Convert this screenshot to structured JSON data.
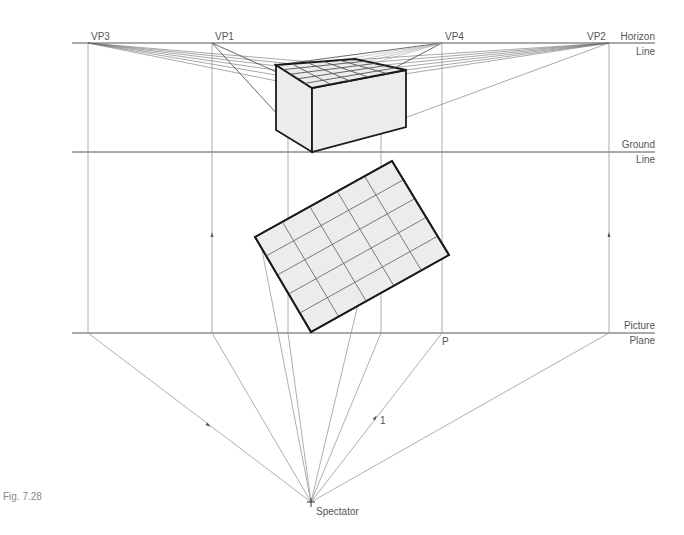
{
  "figure": {
    "caption": "Fig. 7.28",
    "colors": {
      "construction_line": "#9a9a9a",
      "vp_ray": "#6e6e6e",
      "object_outline": "#1a1a1a",
      "grid_line": "#7a7a7a",
      "fill": "#ececec",
      "label": "#555555"
    }
  },
  "reference_lines": {
    "horizon": {
      "label_line1": "Horizon",
      "label_line2": "Line",
      "y": 43
    },
    "ground": {
      "label_line1": "Ground",
      "label_line2": "Line",
      "y": 152
    },
    "picture_plane": {
      "label_line1": "Picture",
      "label_line2": "Plane",
      "y": 333
    }
  },
  "vanishing_points": [
    {
      "id": "VP3",
      "label": "VP3",
      "x": 88,
      "y": 43
    },
    {
      "id": "VP1",
      "label": "VP1",
      "x": 212,
      "y": 43
    },
    {
      "id": "VP4",
      "label": "VP4",
      "x": 442,
      "y": 43
    },
    {
      "id": "VP2",
      "label": "VP2",
      "x": 609,
      "y": 43
    }
  ],
  "points": {
    "spectator": {
      "label": "Spectator",
      "x": 311,
      "y": 502
    },
    "p": {
      "label": "P",
      "x": 442,
      "y": 333
    },
    "marker_1": {
      "label": "1",
      "x": 377,
      "y": 420
    }
  },
  "plan_view": {
    "corners": [
      [
        255,
        237
      ],
      [
        392,
        161
      ],
      [
        449,
        255
      ],
      [
        311,
        332
      ]
    ],
    "grid_divisions": [
      5,
      6
    ]
  },
  "perspective_box": {
    "top_face": [
      [
        276,
        65
      ],
      [
        355,
        59
      ],
      [
        406,
        70
      ],
      [
        312,
        88
      ]
    ],
    "bottom_front": [
      312,
      152
    ],
    "bottom_left": [
      276,
      130
    ],
    "bottom_right": [
      406,
      127
    ]
  }
}
